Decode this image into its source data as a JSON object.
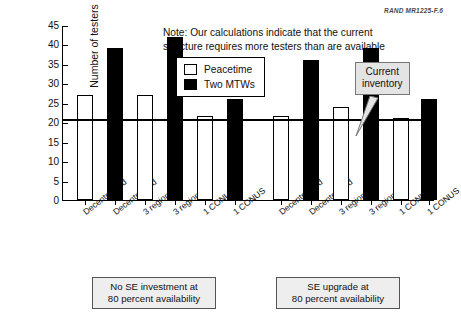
{
  "figure_id": "RAND MR1225-F.6",
  "note": {
    "line1": "Note:  Our calculations indicate that the current",
    "line2": "structure requires more testers than are available"
  },
  "legend": {
    "items": [
      {
        "label": "Peacetime",
        "swatch": "white-square",
        "color": "#ffffff"
      },
      {
        "label": "Two MTWs",
        "swatch": "black-square",
        "color": "#000000"
      }
    ]
  },
  "callout": {
    "line1": "Current",
    "line2": "inventory",
    "value": 21
  },
  "groups": [
    {
      "caption_line1": "No SE investment at",
      "caption_line2": "80 percent availability"
    },
    {
      "caption_line1": "SE upgrade at",
      "caption_line2": "80 percent availability"
    }
  ],
  "axis": {
    "y_title": "Number of testers",
    "y_ticks": [
      "0",
      "5",
      "10",
      "15",
      "20",
      "25",
      "30",
      "35",
      "40",
      "45"
    ]
  },
  "chart_data": {
    "type": "bar",
    "title": "",
    "xlabel": "",
    "ylabel": "Number of testers",
    "ylim": [
      0,
      45
    ],
    "ytick_step": 5,
    "grid": false,
    "legend_position": "upper-center",
    "categories": [
      "Decentralized",
      "Decentralized",
      "3 regionals",
      "3 regionals",
      "1 CONUS",
      "1 CONUS",
      "Decentralized",
      "Decentralized",
      "3 regionals",
      "3 regionals",
      "1 CONUS",
      "1 CONUS"
    ],
    "bar_series": [
      "Peacetime",
      "Two MTWs",
      "Peacetime",
      "Two MTWs",
      "Peacetime",
      "Two MTWs",
      "Peacetime",
      "Two MTWs",
      "Peacetime",
      "Two MTWs",
      "Peacetime",
      "Two MTWs"
    ],
    "values": [
      27,
      39,
      27,
      42,
      21.5,
      26,
      21.5,
      36,
      24,
      39,
      21,
      26
    ],
    "group_labels": [
      "No SE investment at 80 percent availability",
      "SE upgrade at 80 percent availability"
    ],
    "reference_line": {
      "label": "Current inventory",
      "value": 21
    },
    "annotations": [
      "Note:  Our calculations indicate that the current structure requires more testers than are available"
    ]
  }
}
